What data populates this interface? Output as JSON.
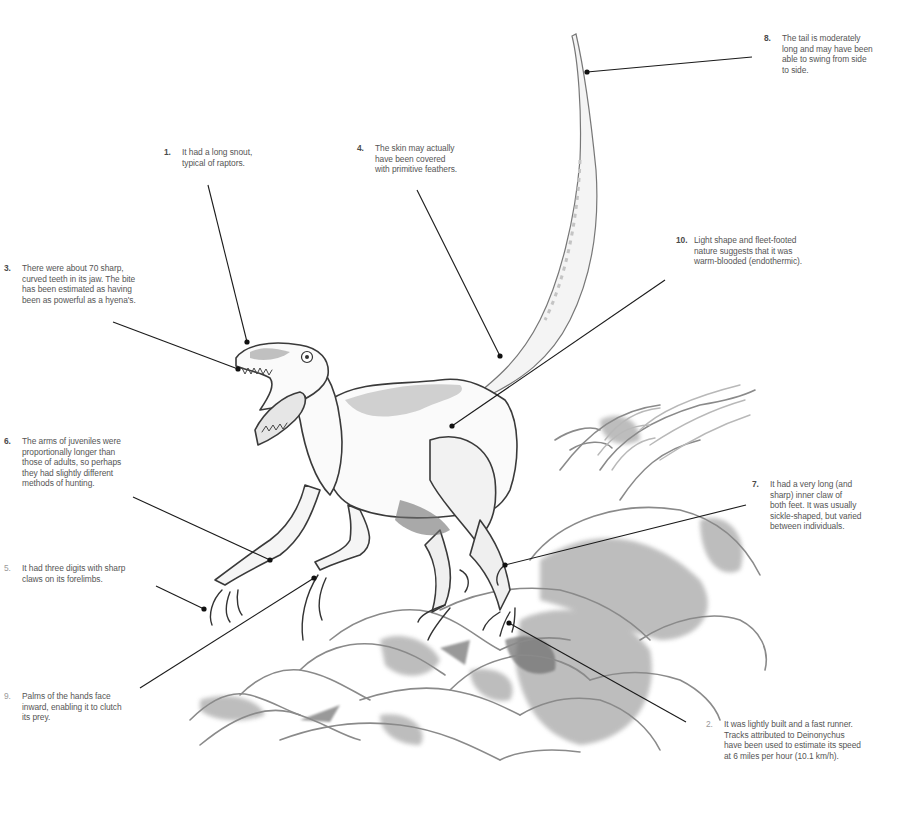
{
  "figure": {
    "style": "pencil and grey wash illustration",
    "colors": {
      "background": "#ffffff",
      "ink": "#2b2b2b",
      "wash": "#9a9a9a",
      "label_text": "#555555",
      "leader_line": "#1a1a1a"
    }
  },
  "annotations": [
    {
      "id": 1,
      "number": "1.",
      "text": "It had a long snout,\ntypical of raptors.",
      "x": 164,
      "y": 147,
      "target": [
        247,
        342
      ]
    },
    {
      "id": 2,
      "number": "2.",
      "text": "It was lightly built and a fast runner.\nTracks attributed to Deinonychus\nhave been used to estimate its speed\nat 6 miles per hour (10.1 km/h).",
      "x": 706,
      "y": 719,
      "target": [
        509,
        623
      ],
      "light": true
    },
    {
      "id": 3,
      "number": "3.",
      "text": "There were about 70 sharp,\ncurved teeth in its jaw. The bite\nhas been estimated as having\nbeen as powerful as a hyena's.",
      "x": 4,
      "y": 263,
      "target": [
        238,
        369
      ]
    },
    {
      "id": 4,
      "number": "4.",
      "text": "The skin may actually\nhave been covered\nwith primitive feathers.",
      "x": 357,
      "y": 143,
      "target": [
        500,
        356
      ]
    },
    {
      "id": 5,
      "number": "5.",
      "text": "It had three digits with sharp\nclaws on its forelimbs.",
      "x": 4,
      "y": 563,
      "target": [
        204,
        609
      ],
      "light": true
    },
    {
      "id": 6,
      "number": "6.",
      "text": "The arms of juveniles were\nproportionally longer than\nthose of adults, so perhaps\nthey had slightly different\nmethods of hunting.",
      "x": 4,
      "y": 436,
      "target": [
        270,
        560
      ]
    },
    {
      "id": 7,
      "number": "7.",
      "text": "It had a very long (and\nsharp) inner claw of\nboth feet. It was usually\nsickle-shaped, but varied\nbetween individuals.",
      "x": 752,
      "y": 479,
      "target": [
        505,
        565
      ]
    },
    {
      "id": 8,
      "number": "8.",
      "text": "The tail is moderately\nlong and may have been\nable to swing from side\nto side.",
      "x": 764,
      "y": 33,
      "target": [
        587,
        72
      ]
    },
    {
      "id": 9,
      "number": "9.",
      "text": "Palms of the hands face\ninward, enabling it to clutch\nits prey.",
      "x": 4,
      "y": 691,
      "target": [
        314,
        578
      ],
      "light": true
    },
    {
      "id": 10,
      "number": "10.",
      "text": "Light shape and fleet-footed\nnature suggests that it was\nwarm-blooded (endothermic).",
      "x": 676,
      "y": 235,
      "target": [
        452,
        426
      ]
    }
  ]
}
